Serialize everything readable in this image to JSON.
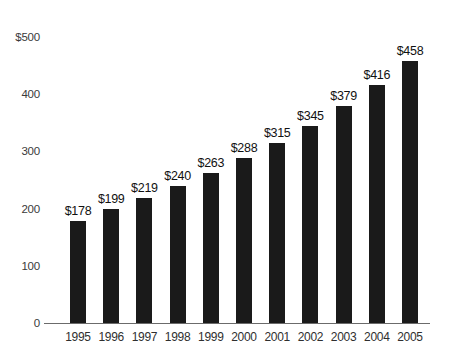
{
  "chart_data": {
    "type": "bar",
    "title": "",
    "xlabel": "",
    "ylabel": "",
    "categories": [
      "1995",
      "1996",
      "1997",
      "1998",
      "1999",
      "2000",
      "2001",
      "2002",
      "2003",
      "2004",
      "2005"
    ],
    "values": [
      178,
      199,
      219,
      240,
      263,
      288,
      315,
      345,
      379,
      416,
      458
    ],
    "data_labels": [
      "$178",
      "$199",
      "$219",
      "$240",
      "$263",
      "$288",
      "$315",
      "$345",
      "$379",
      "$416",
      "$458"
    ],
    "ylim": [
      0,
      500
    ],
    "yticks": [
      0,
      100,
      200,
      300,
      400,
      500
    ],
    "ytick_labels": [
      "0",
      "100",
      "200",
      "300",
      "400",
      "$500"
    ],
    "grid": false,
    "legend": false,
    "bar_color": "#1a1a1a",
    "background_color": "#ffffff",
    "axis_color": "#6b6b6b"
  }
}
